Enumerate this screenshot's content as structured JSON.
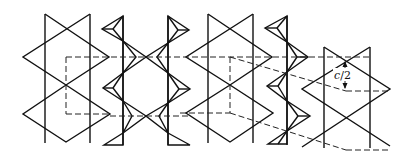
{
  "diagram": {
    "type": "crystal-structure-projection",
    "blocks": [
      {
        "id": "octahedral-strip-1",
        "kind": "octahedra"
      },
      {
        "id": "tetrahedral-chain-1",
        "kind": "tetrahedra"
      },
      {
        "id": "octahedral-strip-2",
        "kind": "octahedra"
      },
      {
        "id": "tetrahedral-chain-2",
        "kind": "tetrahedra"
      },
      {
        "id": "octahedral-strip-3",
        "kind": "octahedra",
        "shifted": true
      }
    ],
    "annotation": {
      "label_var": "c",
      "label_rest": "/2",
      "meaning": "vertical offset of c/2 between strips"
    },
    "colors": {
      "line": "#111111",
      "background": "#ffffff"
    }
  }
}
